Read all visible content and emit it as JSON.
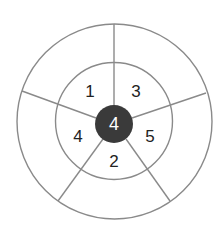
{
  "diagram": {
    "type": "concentric-wheel",
    "center": {
      "label": "4",
      "fill": "#3a3a3a",
      "text_color": "#ffffff"
    },
    "inner_ring_segments": [
      {
        "label": "1",
        "position": "upper-left"
      },
      {
        "label": "3",
        "position": "upper-right"
      },
      {
        "label": "5",
        "position": "right"
      },
      {
        "label": "2",
        "position": "bottom"
      },
      {
        "label": "4",
        "position": "left"
      }
    ],
    "outer_ring_segments": [
      {
        "label": "",
        "position": "upper-left"
      },
      {
        "label": "",
        "position": "upper-right"
      },
      {
        "label": "",
        "position": "right"
      },
      {
        "label": "",
        "position": "bottom"
      },
      {
        "label": "",
        "position": "left"
      }
    ],
    "line_color": "#8a8a8a"
  }
}
